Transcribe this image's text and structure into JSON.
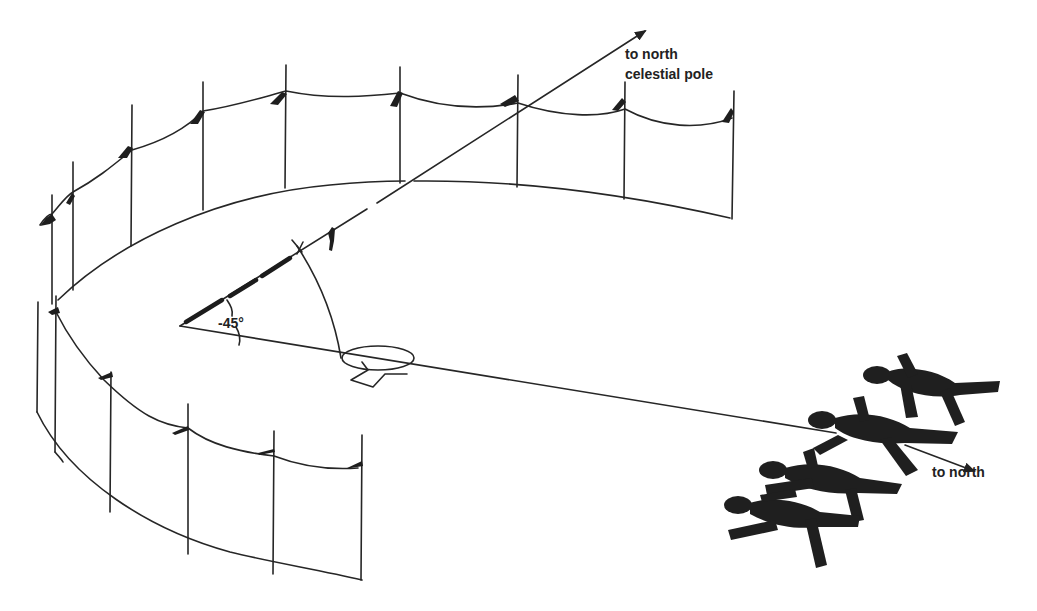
{
  "figure": {
    "type": "diagram",
    "labels": {
      "pole_line_1": "to north",
      "pole_line_2": "celestial pole",
      "angle": "-45°",
      "north": "to north"
    },
    "colors": {
      "ink": "#262626",
      "background": "#ffffff"
    }
  }
}
